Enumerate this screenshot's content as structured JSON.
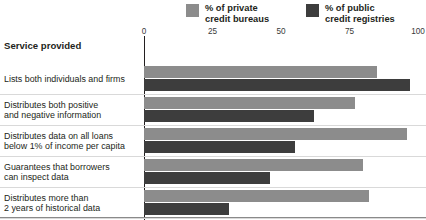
{
  "header": {
    "row_header_label": "Service provided"
  },
  "legend": {
    "position": "top",
    "items": [
      {
        "name": "private-credit-bureaus",
        "line1": "% of private",
        "line2": "credit bureaus",
        "color": "#8c8c8c"
      },
      {
        "name": "public-credit-registries",
        "line1": "% of public",
        "line2": "credit registries",
        "color": "#3d3d3d"
      }
    ]
  },
  "axis": {
    "ticks": [
      "0",
      "25",
      "50",
      "75",
      "100"
    ],
    "min": 0,
    "max": 100
  },
  "chart_data": {
    "type": "bar",
    "orientation": "horizontal",
    "title": "",
    "xlabel": "",
    "ylabel": "Service provided",
    "xlim": [
      0,
      100
    ],
    "grid": false,
    "legend_position": "top",
    "categories": [
      "Lists both individuals and firms",
      "Distributes both positive and negative information",
      "Distributes data on all loans below 1% of income per capita",
      "Guarantees that borrowers can inspect data",
      "Distributes more than 2 years of historical data",
      "Distributes data from retailers, trade creditors or utilities"
    ],
    "category_lines": [
      [
        "Lists both individuals and firms"
      ],
      [
        "Distributes both positive",
        "and negative information"
      ],
      [
        "Distributes data on all loans",
        "below 1% of income per capita"
      ],
      [
        "Guarantees that borrowers",
        "can inspect data"
      ],
      [
        "Distributes more than",
        "2 years of historical data"
      ],
      [
        "Distributes data from retailers,",
        "trade creditors or utilities"
      ]
    ],
    "series": [
      {
        "name": "% of private credit bureaus",
        "color": "#8c8c8c",
        "values": [
          85,
          77,
          96,
          80,
          82,
          63
        ]
      },
      {
        "name": "% of public credit registries",
        "color": "#3d3d3d",
        "values": [
          97,
          62,
          55,
          46,
          31,
          1
        ]
      }
    ]
  }
}
